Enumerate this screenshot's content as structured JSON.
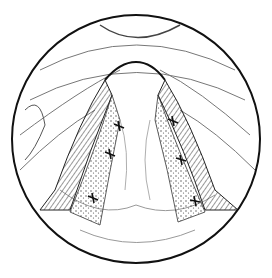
{
  "figure": {
    "type": "medical-illustration",
    "stroke_color": "#1a1a1a",
    "background": "#ffffff",
    "suture_count": 6
  }
}
